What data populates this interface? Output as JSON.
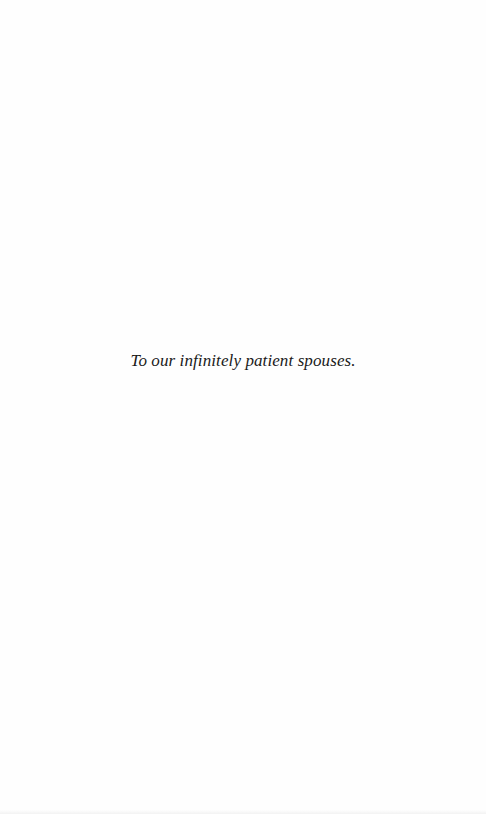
{
  "page": {
    "type": "dedication",
    "dedication_text": "To our infinitely patient spouses."
  }
}
